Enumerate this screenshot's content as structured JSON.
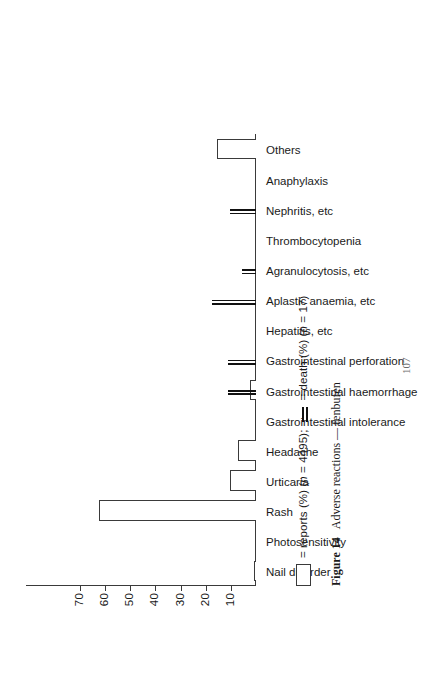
{
  "figure": {
    "number_label": "Figure 14",
    "caption": "Adverse reactions — fenbufen",
    "folio": "107"
  },
  "legend": {
    "reports_text": "= reports (%) (n = 4495);",
    "death_text": "= death (%) (n = 17)",
    "reports_swatch": "hollow-rectangle",
    "death_swatch": "double-vertical-rule"
  },
  "chart_data": {
    "type": "bar",
    "title": "Adverse reactions — fenbufen",
    "xlabel": "",
    "ylabel": "",
    "ylim": [
      0,
      78
    ],
    "yticks": [
      10,
      20,
      30,
      40,
      50,
      60,
      70
    ],
    "ytick_labels": [
      "10",
      "20",
      "30",
      "40",
      "50",
      "60",
      "70"
    ],
    "grid": false,
    "orientation": "vertical-bars-on-rotated-page",
    "legend_position": "below-axis",
    "categories": [
      "Nail disorder",
      "Photosensitivity",
      "Rash",
      "Urticaria",
      "Headache",
      "Gastrointestinal intolerance",
      "Gastrointestinal haemorrhage",
      "Gastrointestinal perforation",
      "Hepatitis, etc",
      "Aplastic anaemia, etc",
      "Agranulocytosis, etc",
      "Thrombocytopenia",
      "Nephritis, etc",
      "Anaphylaxis",
      "Others"
    ],
    "series": [
      {
        "name": "reports (%)",
        "n": 4495,
        "marker": "hollow-rectangle",
        "values": [
          0.7,
          0,
          62.5,
          10.5,
          7.0,
          0,
          2.3,
          0,
          0,
          0,
          0,
          0,
          0,
          0,
          15.5
        ]
      },
      {
        "name": "death (%)",
        "n": 17,
        "marker": "double-vertical-rule",
        "values": [
          0,
          0,
          0,
          0,
          0,
          0,
          11.0,
          11.0,
          0,
          17.5,
          5.5,
          0,
          10.5,
          0,
          0
        ]
      }
    ]
  }
}
